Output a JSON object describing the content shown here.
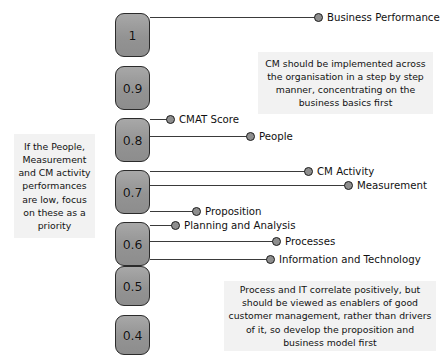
{
  "chart_data": {
    "type": "scatter",
    "title": "",
    "xlabel": "",
    "ylabel": "CMAT Score",
    "ylim": [
      0.4,
      1.0
    ],
    "grid": false,
    "legend_position": "none",
    "axis_ticks": [
      "1",
      "0.9",
      "0.8",
      "0.7",
      "0.6",
      "0.5",
      "0.4"
    ],
    "categories": [
      "Business Performance",
      "CMAT Score",
      "People",
      "CM Activity",
      "Measurement",
      "Proposition",
      "Planning and Analysis",
      "Processes",
      "Information and Technology"
    ],
    "values": [
      0.96,
      0.83,
      0.8,
      0.7,
      0.685,
      0.625,
      0.615,
      0.575,
      0.545
    ],
    "annotations": [
      "If the People, Measurement and CM activity performances are low, focus on these as a priority",
      "CM should be implemented across the organisation in a step by step manner, concentrating on the business basics first",
      "Process and IT correlate positively, but should be viewed as enablers of good customer management, rather than drivers of it, so develop the proposition and business model first"
    ]
  },
  "scale": {
    "name": "score-scale",
    "ticks": [
      {
        "label": "1",
        "top": 13,
        "height": 44
      },
      {
        "label": "0.9",
        "top": 66,
        "height": 44
      },
      {
        "label": "0.8",
        "top": 118,
        "height": 44
      },
      {
        "label": "0.7",
        "top": 170,
        "height": 44
      },
      {
        "label": "0.6",
        "top": 222,
        "height": 44
      },
      {
        "label": "0.5",
        "top": 266,
        "height": 40
      },
      {
        "label": "0.4",
        "top": 315,
        "height": 40
      }
    ]
  },
  "rows": [
    {
      "label": "Business Performance",
      "y": 17,
      "dot_x": 318,
      "line_to": 318,
      "label_x": 327
    },
    {
      "label": "CMAT Score",
      "y": 119,
      "dot_x": 170,
      "line_to": 170,
      "label_x": 179
    },
    {
      "label": "People",
      "y": 136,
      "dot_x": 250,
      "line_to": 250,
      "label_x": 259
    },
    {
      "label": "CM Activity",
      "y": 171,
      "dot_x": 308,
      "line_to": 308,
      "label_x": 317
    },
    {
      "label": "Measurement",
      "y": 185,
      "dot_x": 348,
      "line_to": 348,
      "label_x": 357
    },
    {
      "label": "Proposition",
      "y": 211,
      "dot_x": 196,
      "line_to": 196,
      "label_x": 205
    },
    {
      "label": "Planning and Analysis",
      "y": 225,
      "dot_x": 175,
      "line_to": 175,
      "label_x": 184
    },
    {
      "label": "Processes",
      "y": 241,
      "dot_x": 276,
      "line_to": 276,
      "label_x": 285
    },
    {
      "label": "Information and Technology",
      "y": 259,
      "dot_x": 270,
      "line_to": 270,
      "label_x": 279
    }
  ],
  "notes": {
    "left": {
      "name": "note-people-measurement",
      "text": "If the People, Measurement and CM activity performances are low, focus on these as a priority",
      "x": 14,
      "y": 134,
      "w": 81,
      "h": 104
    },
    "top_right": {
      "name": "note-step-by-step",
      "text": "CM should be implemented across the organisation in a step by step manner, concentrating on the business basics first",
      "x": 258,
      "y": 52,
      "w": 175,
      "h": 62
    },
    "bottom_right": {
      "name": "note-process-it",
      "text": "Process and IT correlate positively, but should be viewed as enablers of good customer management, rather than drivers of it, so develop the proposition and business model first",
      "x": 224,
      "y": 281,
      "w": 212,
      "h": 70
    }
  },
  "geometry": {
    "scale_left": 115,
    "line_start": 150
  }
}
